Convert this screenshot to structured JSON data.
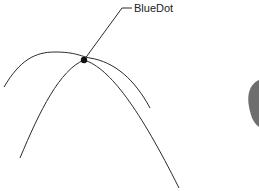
{
  "diagram": {
    "callout_label": "BlueDot",
    "curves": [
      {
        "name": "flat-parabola"
      },
      {
        "name": "steep-parabola"
      }
    ],
    "intersection_point": {
      "label": "BlueDot"
    },
    "colors": {
      "line": "#2a2a2a",
      "dot": "#111111",
      "partial_shape": "#6e6e6e"
    }
  }
}
